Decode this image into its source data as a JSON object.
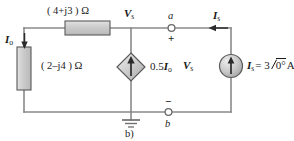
{
  "figure": {
    "caption": "b)",
    "type": "ac-circuit-schematic",
    "width": 294,
    "height": 141
  },
  "colors": {
    "wire": "#8a8a8a",
    "wire_dark": "#4d4d4d",
    "text": "#1a1a1a",
    "component_fill": "#c9c9c9",
    "component_stroke": "#555555",
    "background": "#ffffff"
  },
  "components": {
    "series_impedance": {
      "name": "series-impedance",
      "label": "( 4+j3 ) Ω",
      "orientation": "horizontal"
    },
    "shunt_impedance": {
      "name": "shunt-impedance",
      "label": "( 2–j4 ) Ω",
      "orientation": "vertical"
    },
    "dependent_source": {
      "name": "dependent-current-source",
      "shape": "diamond",
      "label_coeff": "0.5",
      "label_var": "I",
      "label_sub": "o",
      "arrow_direction": "up"
    },
    "independent_source": {
      "name": "independent-current-source",
      "shape": "circle",
      "label_var": "I",
      "label_sub": "s",
      "label_value": "= 3",
      "label_phasor": "0°",
      "label_unit": "A",
      "arrow_direction": "up"
    },
    "ground": {
      "name": "ground-symbol"
    }
  },
  "currents": {
    "io": {
      "var": "I",
      "sub": "o",
      "direction": "down"
    },
    "is": {
      "var": "I",
      "sub": "s",
      "direction": "left"
    }
  },
  "voltages": {
    "vs_top": {
      "var": "V",
      "sub": "s"
    },
    "vs_mid": {
      "var": "V",
      "sub": "s"
    }
  },
  "terminals": {
    "a": {
      "label": "a",
      "polarity": "+"
    },
    "b": {
      "label": "b",
      "polarity": "−"
    }
  }
}
